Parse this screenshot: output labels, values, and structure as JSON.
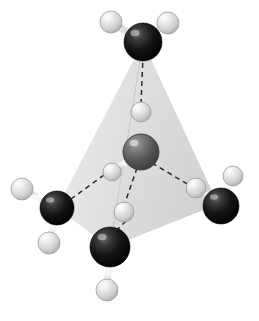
{
  "figure": {
    "title": "Tetrahedral molecular model",
    "background_color": "#ffffff",
    "width": 259,
    "height": 321
  },
  "palette": {
    "carbon_dark": "#1a1a1a",
    "carbon_edge": "#000000",
    "center_atom": "#5a5a5a",
    "center_atom_edge": "#3a3a3a",
    "hydrogen": "#d8d8d8",
    "hydrogen_edge": "#9a9a9a",
    "bond_fill": "#f0f0f0",
    "bond_stroke": "#8c8c8c",
    "tetra_face_light": "#e6e6e6",
    "tetra_face_mid": "#d6d6d6",
    "tetra_face_dark": "#c6c6c6",
    "tetra_edge": "#b4b4b4",
    "dashed_line": "#2b2b2b"
  },
  "tetrahedron": {
    "label": "tetrahedron-shading",
    "vertices": {
      "apex": {
        "name": "apex-top",
        "x": 143,
        "y": 42
      },
      "front_bottom": {
        "name": "vertex-front-bottom",
        "x": 110,
        "y": 247
      },
      "left_back": {
        "name": "vertex-left-back",
        "x": 57,
        "y": 208
      },
      "right_back": {
        "name": "vertex-right-back",
        "x": 218,
        "y": 204
      }
    },
    "faces": [
      {
        "name": "face-left",
        "points": "143,42 57,208 110,247",
        "fill": "#e9e9e9"
      },
      {
        "name": "face-front-right",
        "points": "143,42 110,247 218,204",
        "fill": "#dedede"
      },
      {
        "name": "face-base",
        "points": "57,208 110,247 218,204",
        "fill": "#cfcfcf"
      }
    ]
  },
  "atoms": [
    {
      "name": "carbon-top",
      "element": "C",
      "kind": "carbon",
      "x": 143,
      "y": 42,
      "r": 19
    },
    {
      "name": "carbon-left",
      "element": "C",
      "kind": "carbon",
      "x": 57,
      "y": 208,
      "r": 17
    },
    {
      "name": "carbon-right",
      "element": "C",
      "kind": "carbon",
      "x": 221,
      "y": 206,
      "r": 18
    },
    {
      "name": "carbon-bottom-front",
      "element": "C",
      "kind": "carbon",
      "x": 110,
      "y": 247,
      "r": 20
    },
    {
      "name": "carbon-center",
      "element": "C",
      "kind": "center",
      "x": 141,
      "y": 152,
      "r": 18
    },
    {
      "name": "hydrogen-center-up",
      "element": "H",
      "kind": "hydrogen",
      "x": 141,
      "y": 112,
      "r": 10
    },
    {
      "name": "hydrogen-center-left",
      "element": "H",
      "kind": "hydrogen",
      "x": 112,
      "y": 172,
      "r": 9
    },
    {
      "name": "hydrogen-center-right",
      "element": "H",
      "kind": "hydrogen",
      "x": 196,
      "y": 188,
      "r": 10
    },
    {
      "name": "hydrogen-center-down",
      "element": "H",
      "kind": "hydrogen",
      "x": 124,
      "y": 212,
      "r": 10
    },
    {
      "name": "hydrogen-top-left",
      "element": "H",
      "kind": "hydrogen",
      "x": 111,
      "y": 22,
      "r": 11
    },
    {
      "name": "hydrogen-top-right",
      "element": "H",
      "kind": "hydrogen",
      "x": 168,
      "y": 23,
      "r": 11
    },
    {
      "name": "hydrogen-left-upper",
      "element": "H",
      "kind": "hydrogen",
      "x": 22,
      "y": 189,
      "r": 11
    },
    {
      "name": "hydrogen-left-lower",
      "element": "H",
      "kind": "hydrogen",
      "x": 49,
      "y": 243,
      "r": 11
    },
    {
      "name": "hydrogen-right-upper",
      "element": "H",
      "kind": "hydrogen",
      "x": 233,
      "y": 176,
      "r": 10
    },
    {
      "name": "hydrogen-bottom-front",
      "element": "H",
      "kind": "hydrogen",
      "x": 107,
      "y": 290,
      "r": 11
    }
  ],
  "bonds": [
    {
      "name": "bond-top-to-h-left",
      "from": "carbon-top",
      "to": "hydrogen-top-left",
      "style": "solid-rod"
    },
    {
      "name": "bond-top-to-h-right",
      "from": "carbon-top",
      "to": "hydrogen-top-right",
      "style": "solid-rod"
    },
    {
      "name": "bond-left-to-h-upper",
      "from": "carbon-left",
      "to": "hydrogen-left-upper",
      "style": "solid-rod"
    },
    {
      "name": "bond-left-to-h-lower",
      "from": "carbon-left",
      "to": "hydrogen-left-lower",
      "style": "solid-rod"
    },
    {
      "name": "bond-right-to-h-upper",
      "from": "carbon-right",
      "to": "hydrogen-right-upper",
      "style": "solid-rod"
    },
    {
      "name": "bond-bottom-to-h",
      "from": "carbon-bottom-front",
      "to": "hydrogen-bottom-front",
      "style": "solid-rod"
    },
    {
      "name": "bond-center-to-h-up",
      "from": "carbon-center",
      "to": "hydrogen-center-up",
      "style": "solid-rod"
    },
    {
      "name": "bond-center-to-h-left",
      "from": "carbon-center",
      "to": "hydrogen-center-left",
      "style": "solid-rod"
    },
    {
      "name": "bond-center-to-h-right",
      "from": "carbon-center",
      "to": "hydrogen-center-right",
      "style": "solid-rod"
    },
    {
      "name": "bond-center-to-h-down",
      "from": "carbon-center",
      "to": "hydrogen-center-down",
      "style": "solid-rod"
    }
  ],
  "dashed_bonds": [
    {
      "name": "dashed-h-up-to-carbon-top",
      "x1": 141,
      "y1": 104,
      "x2": 143,
      "y2": 56
    },
    {
      "name": "dashed-h-left-to-carbon-left",
      "x1": 104,
      "y1": 175,
      "x2": 71,
      "y2": 199
    },
    {
      "name": "dashed-h-right-to-carbon-right",
      "x1": 204,
      "y1": 191,
      "x2": 207,
      "y2": 197
    },
    {
      "name": "dashed-center-to-h-right",
      "x1": 152,
      "y1": 163,
      "x2": 189,
      "y2": 185
    },
    {
      "name": "dashed-h-down-to-carbon-bottom",
      "x1": 126,
      "y1": 221,
      "x2": 113,
      "y2": 234
    },
    {
      "name": "dashed-center-to-h-down",
      "x1": 137,
      "y1": 168,
      "x2": 125,
      "y2": 203
    }
  ],
  "tetra_edges": [
    {
      "name": "tetra-edge-left-back-to-right-back",
      "x1": 57,
      "y1": 208,
      "x2": 218,
      "y2": 204
    }
  ]
}
